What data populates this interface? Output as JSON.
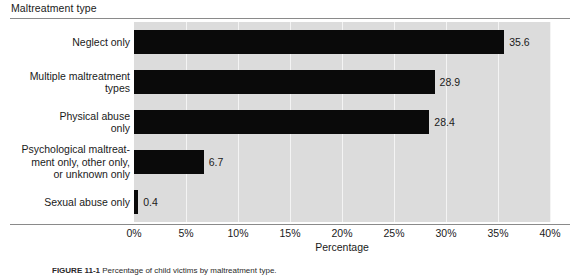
{
  "chart": {
    "title": "Maltreatment type",
    "x_axis_label": "Percentage",
    "caption_label": "FIGURE 11-1",
    "caption_text": "Percentage of child victims by maltreatment type."
  },
  "chart_data": {
    "type": "bar",
    "orientation": "horizontal",
    "title": "Maltreatment type",
    "xlabel": "Percentage",
    "ylabel": "",
    "xlim": [
      0,
      40
    ],
    "xticks": [
      0,
      5,
      10,
      15,
      20,
      25,
      30,
      35,
      40
    ],
    "xtick_labels": [
      "0%",
      "5%",
      "10%",
      "15%",
      "20%",
      "25%",
      "30%",
      "35%",
      "40%"
    ],
    "grid": true,
    "grid_axis": "x",
    "legend": false,
    "plot_background": "#dcdcdc",
    "bar_color": "#0a0a0a",
    "categories": [
      "Neglect only",
      "Multiple maltreatment types",
      "Physical abuse only",
      "Psychological maltreatment only, other only, or unknown only",
      "Sexual abuse only"
    ],
    "category_lines": [
      [
        "Neglect only"
      ],
      [
        "Multiple maltreatment",
        "types"
      ],
      [
        "Physical abuse",
        "only"
      ],
      [
        "Psychological maltreat-",
        "ment only, other only,",
        "or unknown only"
      ],
      [
        "Sexual abuse only"
      ]
    ],
    "values": [
      35.6,
      28.9,
      28.4,
      6.7,
      0.4
    ],
    "value_labels": [
      "35.6",
      "28.9",
      "28.4",
      "6.7",
      "0.4"
    ]
  }
}
